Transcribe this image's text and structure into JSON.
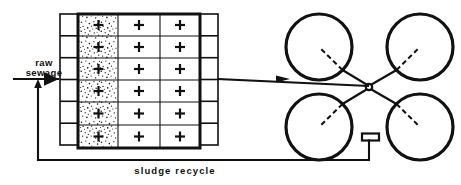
{
  "diagram": {
    "background_color": "#ffffff",
    "line_color": "#111111",
    "width": 461,
    "height": 185
  },
  "labels": {
    "influent_line1": "raw",
    "influent_line2": "sewage",
    "recycle": "sludge  recycle"
  },
  "aeration_tank": {
    "name": "aeration-tank",
    "rows": 6,
    "columns": 3,
    "stippled_column_index": 0,
    "cell_symbol": "+",
    "x": 78,
    "y": 14,
    "width": 122,
    "height": 134,
    "column_x_edges": [
      78,
      118,
      160,
      200
    ],
    "row_y_edges": [
      14,
      36,
      58,
      80,
      102,
      125,
      148
    ],
    "cells": [
      [
        {
          "symbol": "+",
          "stippled": true
        },
        {
          "symbol": "+",
          "stippled": false
        },
        {
          "symbol": "+",
          "stippled": false
        }
      ],
      [
        {
          "symbol": "+",
          "stippled": true
        },
        {
          "symbol": "+",
          "stippled": false
        },
        {
          "symbol": "+",
          "stippled": false
        }
      ],
      [
        {
          "symbol": "+",
          "stippled": true
        },
        {
          "symbol": "+",
          "stippled": false
        },
        {
          "symbol": "+",
          "stippled": false
        }
      ],
      [
        {
          "symbol": "+",
          "stippled": true
        },
        {
          "symbol": "+",
          "stippled": false
        },
        {
          "symbol": "+",
          "stippled": false
        }
      ],
      [
        {
          "symbol": "+",
          "stippled": true
        },
        {
          "symbol": "+",
          "stippled": false
        },
        {
          "symbol": "+",
          "stippled": false
        }
      ],
      [
        {
          "symbol": "+",
          "stippled": true
        },
        {
          "symbol": "+",
          "stippled": false
        },
        {
          "symbol": "+",
          "stippled": false
        }
      ]
    ]
  },
  "inlet_channel": {
    "name": "inlet-distribution-channel",
    "boxes": 6,
    "x": 60,
    "y": 14,
    "width": 18,
    "height": 131
  },
  "outlet_channel": {
    "name": "outlet-collection-channel",
    "boxes": 6,
    "x": 200,
    "y": 14,
    "width": 18,
    "height": 131
  },
  "clarifiers": [
    {
      "name": "clarifier-top-left",
      "cx": 319,
      "cy": 47,
      "r": 33
    },
    {
      "name": "clarifier-top-right",
      "cx": 420,
      "cy": 47,
      "r": 33
    },
    {
      "name": "clarifier-bottom-left",
      "cx": 319,
      "cy": 127,
      "r": 33
    },
    {
      "name": "clarifier-bottom-right",
      "cx": 420,
      "cy": 127,
      "r": 33
    }
  ],
  "junction": {
    "name": "distribution-junction",
    "cx": 369,
    "cy": 87,
    "r": 3.2
  },
  "pump_valve": {
    "name": "recycle-pump-valve",
    "x": 362,
    "y": 134,
    "width": 17,
    "height": 7,
    "stem_x": 369,
    "stem_bottom_y": 160
  },
  "flow_paths": {
    "influent_inlet": {
      "name": "raw-sewage-inlet-pipe",
      "from_x": 14,
      "to_x": 60,
      "y": 79
    },
    "tank_to_clarifier": {
      "name": "tank-to-clarifier-pipe",
      "from_x": 218,
      "to_x": 290,
      "y": 79
    },
    "sludge_recycle": {
      "name": "sludge-recycle-pipe",
      "riser_x": 38,
      "bottom_y": 160,
      "right_x": 369,
      "arrow_top_y": 83
    }
  }
}
